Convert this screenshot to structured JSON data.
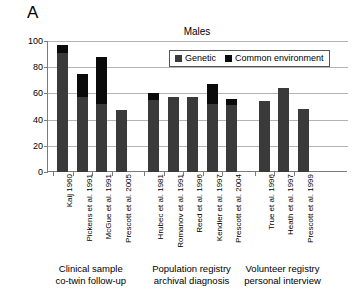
{
  "figure": {
    "panel_label": "A",
    "title": "Males"
  },
  "chart_data": {
    "type": "bar",
    "title": "Males",
    "xlabel": "",
    "ylabel": "% Variance",
    "ylim": [
      0,
      100
    ],
    "yticks": [
      0,
      20,
      40,
      60,
      80,
      100
    ],
    "grid": true,
    "stacked": true,
    "legend_position": "top-right",
    "legend": [
      "Genetic",
      "Common environment"
    ],
    "colors": {
      "genetic": "#3a3a3a",
      "common_environment": "#0a0a0a",
      "gridline": "#b4b4b4",
      "axis": "#7b7b7b"
    },
    "categories": [
      "Kaij 1960",
      "Pickens et al. 1991",
      "McGue et al. 1991",
      "Prescott et al. 2005",
      "Hrubec et al. 1981",
      "Romanov et al. 1991",
      "Reed et al. 1996",
      "Kendler et al. 1997",
      "Prescott et al. 2004",
      "True et al. 1996",
      "Heath et al. 1997",
      "Prescott et al. 1999"
    ],
    "series": [
      {
        "name": "Genetic",
        "values": [
          91,
          57,
          52,
          47,
          55,
          57,
          57,
          52,
          51,
          54,
          64,
          48
        ]
      },
      {
        "name": "Common environment",
        "values": [
          6,
          18,
          36,
          0,
          5,
          0,
          0,
          15,
          5,
          0,
          0,
          0
        ]
      }
    ],
    "totals": [
      97,
      75,
      88,
      47,
      60,
      57,
      57,
      67,
      56,
      54,
      64,
      48
    ],
    "groups": [
      {
        "caption_line1": "Clinical sample",
        "caption_line2": "co-twin follow-up",
        "categories": [
          "Kaij 1960",
          "Pickens et al. 1991",
          "McGue et al. 1991",
          "Prescott et al. 2005"
        ]
      },
      {
        "caption_line1": "Population registry",
        "caption_line2": "archival diagnosis",
        "categories": [
          "Hrubec et al. 1981",
          "Romanov et al. 1991",
          "Reed et al. 1996",
          "Kendler et al. 1997",
          "Prescott et al. 2004"
        ]
      },
      {
        "caption_line1": "Volunteer registry",
        "caption_line2": "personal interview",
        "categories": [
          "True et al. 1996",
          "Heath et al. 1997",
          "Prescott et al. 1999"
        ]
      }
    ]
  }
}
